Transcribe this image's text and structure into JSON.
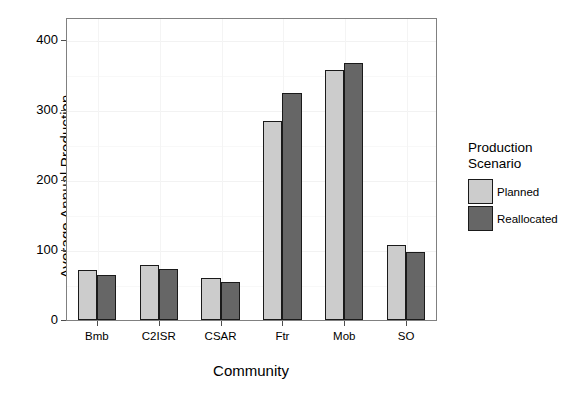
{
  "chart_data": {
    "type": "bar",
    "title": "",
    "xlabel": "Community",
    "ylabel": "Average Annual Production",
    "categories": [
      "Bmb",
      "C2ISR",
      "CSAR",
      "Ftr",
      "Mob",
      "SO"
    ],
    "series": [
      {
        "name": "Planned",
        "color": "#cccccc",
        "values": [
          72,
          79,
          60,
          284,
          357,
          107
        ]
      },
      {
        "name": "Reallocated",
        "color": "#666666",
        "values": [
          65,
          73,
          54,
          324,
          367,
          97
        ]
      }
    ],
    "ylim": [
      0,
      420
    ],
    "yticks": [
      0,
      100,
      200,
      300,
      400
    ],
    "yticklabels": [
      "0",
      "100",
      "200",
      "300",
      "400"
    ],
    "grid": true,
    "legend": {
      "title": "Production\nScenario",
      "position": "right",
      "entries": [
        {
          "label": "Planned",
          "color": "#cccccc"
        },
        {
          "label": "Reallocated",
          "color": "#666666"
        }
      ]
    }
  }
}
